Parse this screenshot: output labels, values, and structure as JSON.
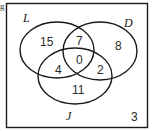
{
  "diagram": {
    "type": "venn",
    "corner_fragment": "g",
    "sets": [
      {
        "label": "L"
      },
      {
        "label": "D"
      },
      {
        "label": "J"
      }
    ],
    "regions": {
      "L_only": "15",
      "L_and_D_only": "7",
      "D_only": "8",
      "L_D_J": "0",
      "L_and_J_only": "4",
      "D_and_J_only": "2",
      "J_only": "11",
      "outside": "3"
    }
  }
}
